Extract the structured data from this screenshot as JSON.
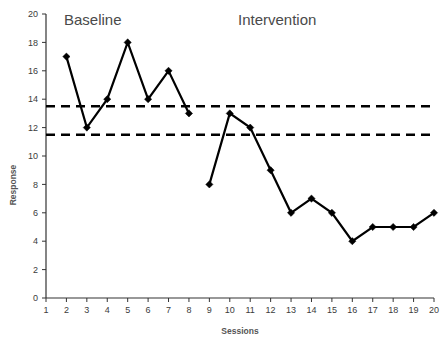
{
  "chart_data": {
    "type": "line",
    "title": "",
    "xlabel": "Sessions",
    "ylabel": "Response",
    "xlim": [
      1,
      20
    ],
    "ylim": [
      0,
      20
    ],
    "x_ticks": [
      1,
      2,
      3,
      4,
      5,
      6,
      7,
      8,
      9,
      10,
      11,
      12,
      13,
      14,
      15,
      16,
      17,
      18,
      19,
      20
    ],
    "y_ticks": [
      0,
      2,
      4,
      6,
      8,
      10,
      12,
      14,
      16,
      18,
      20
    ],
    "grid": false,
    "legend": "none",
    "series": [
      {
        "name": "Baseline",
        "x": [
          2,
          3,
          4,
          5,
          6,
          7,
          8
        ],
        "values": [
          17,
          12,
          14,
          18,
          14,
          16,
          13
        ],
        "marker": "diamond",
        "color": "#000000"
      },
      {
        "name": "Intervention",
        "x": [
          9,
          10,
          11,
          12,
          13,
          14,
          15,
          16,
          17,
          18,
          19,
          20
        ],
        "values": [
          8,
          13,
          12,
          9,
          6,
          7,
          6,
          4,
          5,
          5,
          5,
          6
        ],
        "marker": "diamond",
        "color": "#000000"
      }
    ],
    "reference_lines": [
      {
        "name": "upper-criterion-line",
        "y": 13.5,
        "style": "dashed"
      },
      {
        "name": "lower-criterion-line",
        "y": 11.5,
        "style": "dashed"
      }
    ],
    "annotations": [
      {
        "name": "baseline-phase-label",
        "text": "Baseline",
        "x": 3.1,
        "y": 19.3
      },
      {
        "name": "intervention-phase-label",
        "text": "Intervention",
        "x": 12.6,
        "y": 19.3
      }
    ]
  },
  "axis": {
    "x_title": "Sessions",
    "y_title": "Response",
    "x_tick_labels": [
      "1",
      "2",
      "3",
      "4",
      "5",
      "6",
      "7",
      "8",
      "9",
      "10",
      "11",
      "12",
      "13",
      "14",
      "15",
      "16",
      "17",
      "18",
      "19",
      "20"
    ],
    "y_tick_labels": [
      "20",
      "18",
      "16",
      "14",
      "12",
      "10",
      "8",
      "6",
      "4",
      "2",
      "0"
    ]
  },
  "phases": {
    "baseline_label": "Baseline",
    "intervention_label": "Intervention"
  },
  "colors": {
    "series": "#000000",
    "axis": "#333333",
    "tick_text": "#3b3b3b",
    "phase_text": "#4a4a4a",
    "background": "#ffffff"
  }
}
